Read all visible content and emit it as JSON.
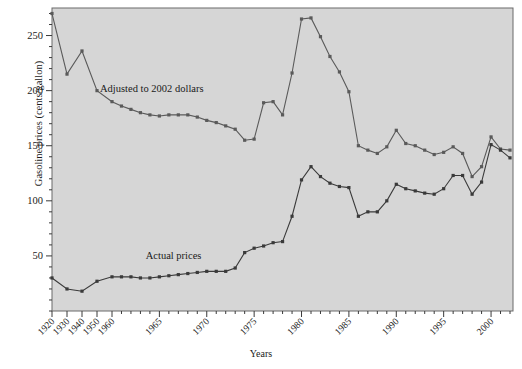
{
  "chart_data": {
    "type": "line",
    "title": "",
    "xlabel": "Years",
    "ylabel": "Gasoline prices (cents/gallon)",
    "ylim": [
      0,
      275
    ],
    "yticks": [
      50,
      100,
      150,
      200,
      250
    ],
    "yminor_step": 10,
    "grid": false,
    "legend_position": "inline-annotations",
    "x_axis_note": "Decade ticks 1920-1960, then annual ticks 1960-2002",
    "xticks_labeled": [
      "1920",
      "1930",
      "1940",
      "1950",
      "1960",
      "1965",
      "1970",
      "1975",
      "1980",
      "1985",
      "1990",
      "1995",
      "2000"
    ],
    "annotations": [
      {
        "text": "Adjusted to 2002 dollars",
        "x": 1964.2,
        "y": 199
      },
      {
        "text": "Actual prices",
        "x": 1966.5,
        "y": 47
      }
    ],
    "series": [
      {
        "name": "Adjusted to 2002 dollars",
        "color": "#5a5a5a",
        "x": [
          1920,
          1930,
          1940,
          1950,
          1960,
          1961,
          1962,
          1963,
          1964,
          1965,
          1966,
          1967,
          1968,
          1969,
          1970,
          1971,
          1972,
          1973,
          1974,
          1975,
          1976,
          1977,
          1978,
          1979,
          1980,
          1981,
          1982,
          1983,
          1984,
          1985,
          1986,
          1987,
          1988,
          1989,
          1990,
          1991,
          1992,
          1993,
          1994,
          1995,
          1996,
          1997,
          1998,
          1999,
          2000,
          2001,
          2002
        ],
        "values": [
          270,
          215,
          236,
          200,
          190,
          186,
          183,
          180,
          178,
          177,
          178,
          178,
          178,
          176,
          173,
          171,
          168,
          165,
          155,
          156,
          189,
          190,
          178,
          216,
          265,
          266,
          249,
          231,
          217,
          199,
          150,
          146,
          143,
          149,
          164,
          152,
          150,
          146,
          142,
          144,
          149,
          143,
          122,
          131,
          158,
          147,
          146
        ]
      },
      {
        "name": "Actual prices",
        "color": "#3a3a3a",
        "x": [
          1920,
          1930,
          1940,
          1950,
          1960,
          1961,
          1962,
          1963,
          1964,
          1965,
          1966,
          1967,
          1968,
          1969,
          1970,
          1971,
          1972,
          1973,
          1974,
          1975,
          1976,
          1977,
          1978,
          1979,
          1980,
          1981,
          1982,
          1983,
          1984,
          1985,
          1986,
          1987,
          1988,
          1989,
          1990,
          1991,
          1992,
          1993,
          1994,
          1995,
          1996,
          1997,
          1998,
          1999,
          2000,
          2001,
          2002
        ],
        "values": [
          30,
          20,
          18,
          27,
          31,
          31,
          31,
          30,
          30,
          31,
          32,
          33,
          34,
          35,
          36,
          36,
          36,
          39,
          53,
          57,
          59,
          62,
          63,
          86,
          119,
          131,
          122,
          116,
          113,
          112,
          86,
          90,
          90,
          100,
          115,
          111,
          109,
          107,
          106,
          111,
          123,
          123,
          106,
          117,
          151,
          146,
          139
        ]
      }
    ]
  },
  "axis": {
    "ylabel": "Gasoline prices (cents/gallon)",
    "xlabel": "Years"
  }
}
